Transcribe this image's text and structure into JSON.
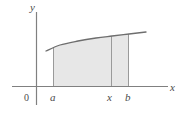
{
  "figure": {
    "background_color": "#ffffff",
    "axis_color": "#808080",
    "curve_color": "#6e6e6e",
    "fill_color": "#e7e7e7",
    "label_color": "#4a4a4a",
    "boundary_line_color": "#9a9a9a"
  },
  "axes": {
    "y_axis_label": "y",
    "x_axis_label": "x",
    "origin_label": "0"
  },
  "tick_labels": {
    "a": "a",
    "x": "x",
    "b": "b"
  },
  "chart_data": {
    "type": "area",
    "title": "",
    "xlabel": "x",
    "ylabel": "y",
    "x_tick_values": [
      "0",
      "a",
      "x",
      "b"
    ],
    "y_tick_values": [],
    "grid": false,
    "legend": null,
    "curve_points_px": [
      [
        46,
        51
      ],
      [
        60,
        45
      ],
      [
        78,
        41
      ],
      [
        96,
        38
      ],
      [
        112,
        36
      ],
      [
        129,
        34
      ],
      [
        146,
        32
      ]
    ],
    "shaded_region": {
      "left_bound": "a",
      "right_bound": "b",
      "left_bound_px": 53.5,
      "right_bound_px": 128.5,
      "baseline_px": 86.5
    },
    "interior_line": {
      "label": "x",
      "x_px": 111.5
    },
    "axis_px": {
      "x_axis_y": 86.5,
      "y_axis_x": 36.5,
      "x_axis_start": 12,
      "x_axis_end": 168,
      "y_axis_top": 12,
      "y_axis_bottom": 105
    }
  }
}
